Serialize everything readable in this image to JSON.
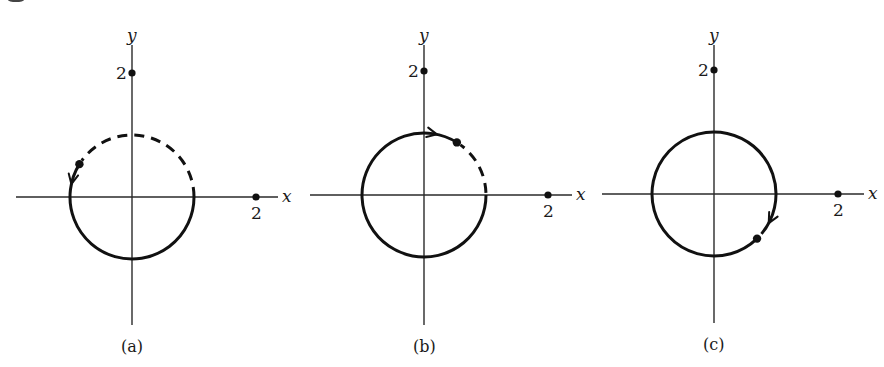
{
  "figure": {
    "panels": [
      {
        "id": "a",
        "caption": "(a)",
        "x_label": "x",
        "y_label": "y",
        "x_tick": {
          "value": 2,
          "label": "2"
        },
        "y_tick": {
          "value": 2,
          "label": "2"
        },
        "circle_radius": 1,
        "point_angle_deg": 148,
        "direction": "counterclockwise",
        "solid_arc": {
          "from_deg": 0,
          "to_deg": 148,
          "sweep": "clockwise-through-bottom"
        },
        "dashed_arc": {
          "from_deg": 0,
          "to_deg": 148,
          "sweep": "counterclockwise-through-top"
        },
        "arrow_angle_deg": 168
      },
      {
        "id": "b",
        "caption": "(b)",
        "x_label": "x",
        "y_label": "y",
        "x_tick": {
          "value": 2,
          "label": "2"
        },
        "y_tick": {
          "value": 2,
          "label": "2"
        },
        "circle_radius": 1,
        "point_angle_deg": 58,
        "direction": "clockwise",
        "solid_arc": {
          "from_deg": 58,
          "to_deg": 360,
          "sweep": "counterclockwise"
        },
        "dashed_arc": {
          "from_deg": 0,
          "to_deg": 58,
          "sweep": "counterclockwise"
        },
        "arrow_angle_deg": 78
      },
      {
        "id": "c",
        "caption": "(c)",
        "x_label": "x",
        "y_label": "y",
        "x_tick": {
          "value": 2,
          "label": "2"
        },
        "y_tick": {
          "value": 2,
          "label": "2"
        },
        "circle_radius": 1,
        "point_angle_deg": -46,
        "direction": "clockwise",
        "solid_arc": {
          "from_deg": -40,
          "to_deg": 313,
          "sweep": "counterclockwise"
        },
        "dashed_arc": null,
        "arrow_angle_deg": -28
      }
    ]
  }
}
